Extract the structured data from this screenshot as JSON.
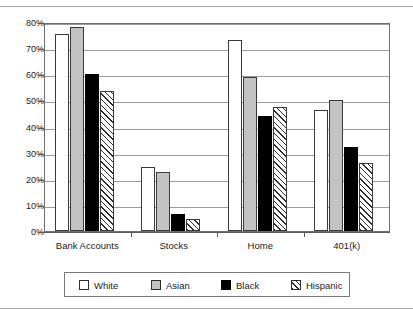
{
  "chart_data": {
    "type": "bar",
    "title": "",
    "subtitle": "",
    "xlabel": "",
    "ylabel": "",
    "categories": [
      "Bank Accounts",
      "Stocks",
      "Home",
      "401(k)"
    ],
    "series": [
      {
        "name": "White",
        "values": [
          75.5,
          24.5,
          73.0,
          46.5
        ],
        "style": "open",
        "color": "#ffffff"
      },
      {
        "name": "Asian",
        "values": [
          78.0,
          22.5,
          59.0,
          50.0
        ],
        "style": "gray",
        "color": "#c2c2c2"
      },
      {
        "name": "Black",
        "values": [
          60.0,
          6.5,
          44.0,
          32.0
        ],
        "style": "solid",
        "color": "#000000"
      },
      {
        "name": "Hispanic",
        "values": [
          53.5,
          4.5,
          47.5,
          26.0
        ],
        "style": "hatch",
        "color": "#ffffff"
      }
    ],
    "ylim": [
      0,
      80
    ],
    "ytick_step": 10,
    "ytick_labels": [
      "0%",
      "10%",
      "20%",
      "30%",
      "40%",
      "50%",
      "60%",
      "70%",
      "80%"
    ],
    "ytick_values": [
      0,
      10,
      20,
      30,
      40,
      50,
      60,
      70,
      80
    ],
    "grid": true,
    "grid_axis": "y",
    "legend_position": "bottom",
    "value_suffix": "%"
  },
  "legend": {
    "entries": [
      {
        "label": "White",
        "swatch": "white-swatch-icon"
      },
      {
        "label": "Asian",
        "swatch": "gray-swatch-icon"
      },
      {
        "label": "Black",
        "swatch": "black-swatch-icon"
      },
      {
        "label": "Hispanic",
        "swatch": "hatched-swatch-icon"
      }
    ]
  },
  "colors": {
    "white_series": "#ffffff",
    "asian_series": "#c2c2c2",
    "black_series": "#000000",
    "hispanic_series": "#ffffff",
    "bar_outline": "#3a3a3a",
    "gridline": "#9a9a9a",
    "axis": "#5a5a5a",
    "frame": "#6e6e6e",
    "rule": "#a8a8a8",
    "text": "#1a1a1a"
  }
}
